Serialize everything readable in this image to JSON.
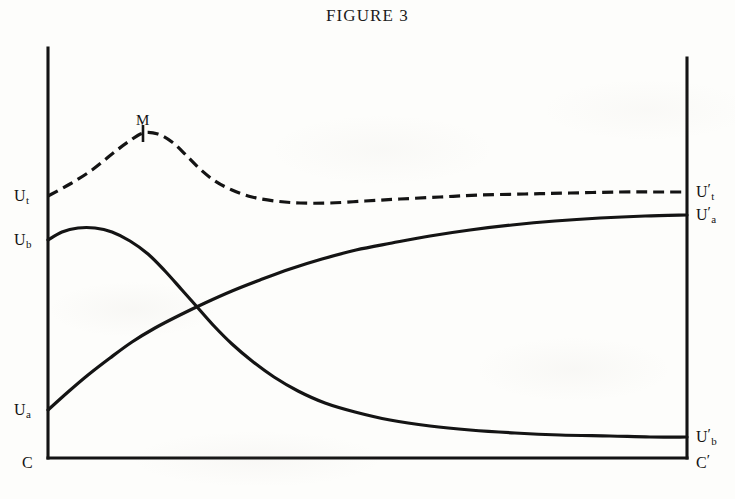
{
  "figure": {
    "caption_lead": "F",
    "caption_rest": "IGURE",
    "caption_number": "3",
    "caption_full": "FIGURE 3"
  },
  "labels": {
    "left_top": {
      "base": "U",
      "sub": "t",
      "prime": ""
    },
    "left_mid": {
      "base": "U",
      "sub": "b",
      "prime": ""
    },
    "left_low": {
      "base": "U",
      "sub": "a",
      "prime": ""
    },
    "origin": {
      "base": "C",
      "sub": "",
      "prime": ""
    },
    "right_top": {
      "base": "U",
      "sub": "t",
      "prime": "′"
    },
    "right_upper": {
      "base": "U",
      "sub": "a",
      "prime": "′"
    },
    "right_low": {
      "base": "U",
      "sub": "b",
      "prime": "′"
    },
    "right_origin": {
      "base": "C",
      "sub": "",
      "prime": "′"
    },
    "peak": "M"
  },
  "colors": {
    "ink": "#141414",
    "paper": "#fdfdfb"
  },
  "chart_data": {
    "type": "line",
    "title": "FIGURE 3",
    "xlabel": "",
    "ylabel": "",
    "grid": false,
    "legend": null,
    "axis": {
      "left_axis_x": 48,
      "right_axis_x": 687,
      "baseline_y": 458,
      "left_axis_top_y": 48,
      "right_axis_top_y": 58
    },
    "annotations": [
      {
        "text": "M",
        "x": 143,
        "y": 133,
        "note": "maximum of total-utility (dashed) curve, marked with tick"
      }
    ],
    "axis_value_labels": {
      "left": [
        {
          "label": "U_t",
          "y": 196
        },
        {
          "label": "U_b",
          "y": 240
        },
        {
          "label": "U_a",
          "y": 410
        },
        {
          "label": "C",
          "y": 458
        }
      ],
      "right": [
        {
          "label": "U'_t",
          "y": 192
        },
        {
          "label": "U'_a",
          "y": 215
        },
        {
          "label": "U'_b",
          "y": 437
        },
        {
          "label": "C'",
          "y": 458
        }
      ]
    },
    "series": [
      {
        "name": "total utility (U_t to U'_t)",
        "style": "dashed",
        "start_label": "U_t",
        "end_label": "U'_t",
        "points": [
          [
            48,
            196
          ],
          [
            70,
            184
          ],
          [
            92,
            170
          ],
          [
            112,
            154
          ],
          [
            128,
            142
          ],
          [
            143,
            133
          ],
          [
            158,
            134
          ],
          [
            172,
            142
          ],
          [
            186,
            155
          ],
          [
            200,
            169
          ],
          [
            215,
            181
          ],
          [
            232,
            190
          ],
          [
            252,
            197
          ],
          [
            275,
            201
          ],
          [
            300,
            203
          ],
          [
            330,
            203
          ],
          [
            365,
            201
          ],
          [
            400,
            199
          ],
          [
            440,
            197
          ],
          [
            480,
            195
          ],
          [
            525,
            194
          ],
          [
            570,
            193
          ],
          [
            620,
            192
          ],
          [
            660,
            192
          ],
          [
            687,
            192
          ]
        ]
      },
      {
        "name": "utility of B (U_b to U'_b), declining",
        "style": "solid",
        "start_label": "U_b",
        "end_label": "U'_b",
        "points": [
          [
            48,
            240
          ],
          [
            62,
            232
          ],
          [
            78,
            228
          ],
          [
            95,
            228
          ],
          [
            112,
            232
          ],
          [
            130,
            241
          ],
          [
            148,
            254
          ],
          [
            165,
            271
          ],
          [
            182,
            290
          ],
          [
            198,
            308
          ],
          [
            214,
            326
          ],
          [
            232,
            344
          ],
          [
            252,
            361
          ],
          [
            274,
            377
          ],
          [
            298,
            391
          ],
          [
            325,
            403
          ],
          [
            355,
            412
          ],
          [
            390,
            420
          ],
          [
            430,
            426
          ],
          [
            470,
            430
          ],
          [
            515,
            433
          ],
          [
            560,
            435
          ],
          [
            610,
            436
          ],
          [
            650,
            437
          ],
          [
            687,
            437
          ]
        ]
      },
      {
        "name": "utility of A (U_a to U'_a), rising",
        "style": "solid",
        "start_label": "U_a",
        "end_label": "U'_a",
        "points": [
          [
            48,
            410
          ],
          [
            68,
            392
          ],
          [
            88,
            375
          ],
          [
            110,
            358
          ],
          [
            132,
            342
          ],
          [
            155,
            328
          ],
          [
            180,
            315
          ],
          [
            205,
            303
          ],
          [
            232,
            291
          ],
          [
            260,
            280
          ],
          [
            290,
            269
          ],
          [
            322,
            259
          ],
          [
            356,
            250
          ],
          [
            392,
            243
          ],
          [
            430,
            236
          ],
          [
            470,
            230
          ],
          [
            512,
            225
          ],
          [
            555,
            221
          ],
          [
            600,
            218
          ],
          [
            645,
            216
          ],
          [
            687,
            215
          ]
        ]
      }
    ],
    "intersection": {
      "x": 205,
      "y": 315,
      "note": "rising A curve crosses declining B curve"
    }
  }
}
